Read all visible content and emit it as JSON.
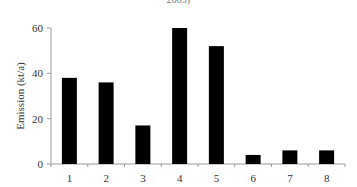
{
  "chart_data": {
    "type": "bar",
    "title": "2005)",
    "xlabel": "",
    "ylabel": "Emission (kt/a)",
    "categories": [
      "1",
      "2",
      "3",
      "4",
      "5",
      "6",
      "7",
      "8"
    ],
    "values": [
      38,
      36,
      17,
      60,
      52,
      4,
      6,
      6
    ],
    "ylim": [
      0,
      60
    ],
    "yticks": [
      0,
      20,
      40,
      60
    ],
    "grid": false,
    "legend": null,
    "bar_color": "#000000"
  }
}
